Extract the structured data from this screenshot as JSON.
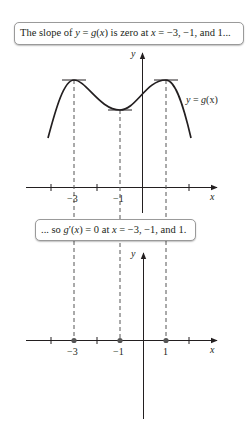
{
  "callouts": {
    "top": {
      "parts": [
        "The slope of ",
        "y",
        " = ",
        "g",
        "(",
        "x",
        ") is zero at ",
        "x",
        " = −3, −1, and 1..."
      ]
    },
    "middle": {
      "parts": [
        "... so ",
        "g",
        "′(",
        "x",
        ") = 0 at ",
        "x",
        " = −3, −1, and 1."
      ]
    }
  },
  "top_graph": {
    "y_axis_label": "y",
    "x_axis_label": "x",
    "curve_label": {
      "lhs": "y",
      "eq": " = ",
      "fn": "g",
      "arg": "(x)"
    },
    "tick_labels": [
      "−3",
      "−1",
      "1"
    ],
    "critical_points": [
      {
        "x": -3,
        "type": "local max"
      },
      {
        "x": -1,
        "type": "local min"
      },
      {
        "x": 1,
        "type": "local max"
      }
    ]
  },
  "bottom_graph": {
    "y_axis_label": "y",
    "x_axis_label": "x",
    "tick_labels": [
      "−3",
      "−1",
      "1"
    ],
    "zero_points": [
      -3,
      -1,
      1
    ]
  },
  "colors": {
    "ink": "#231f20",
    "dash": "#555555",
    "callout_border": "#9a9a9a"
  }
}
